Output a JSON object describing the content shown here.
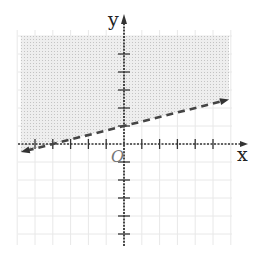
{
  "chart_data": {
    "type": "line",
    "title": "",
    "xlabel": "x",
    "ylabel": "y",
    "origin_label": "O",
    "xlim": [
      -6,
      7
    ],
    "ylim": [
      -6,
      6
    ],
    "x_ticks": [
      -5,
      -4,
      -3,
      -2,
      -1,
      1,
      2,
      3,
      4,
      5
    ],
    "y_ticks": [
      -5,
      -4,
      -3,
      -2,
      -1,
      1,
      2,
      3,
      4,
      5
    ],
    "grid": true,
    "series": [
      {
        "name": "boundary",
        "equation": "y = 1/4 x + 1",
        "slope": 0.25,
        "intercept": 1,
        "style": "dashed",
        "x": [
          -5.8,
          5.9
        ],
        "y": [
          -0.45,
          2.475
        ]
      }
    ],
    "shaded_region": "above",
    "inequality": "y > 1/4 x + 1",
    "colors": {
      "axis": "#333333",
      "line": "#444444",
      "shade": "#d9d9d9",
      "grid": "#e8e8e8"
    }
  }
}
